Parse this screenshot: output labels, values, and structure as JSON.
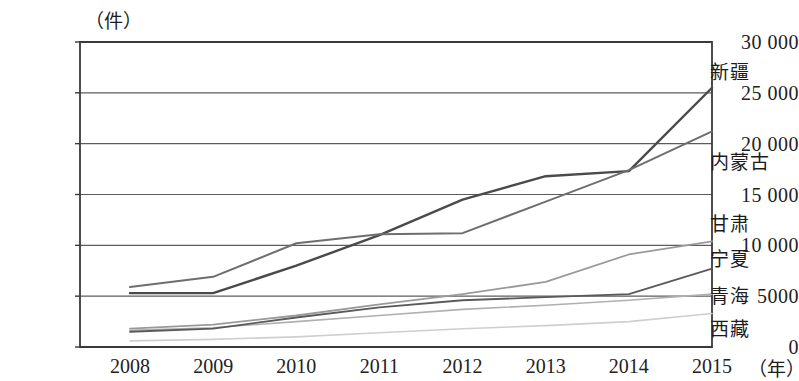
{
  "chart_data": {
    "type": "line",
    "title": "",
    "unit_y": "（件）",
    "unit_x": "（年）",
    "xlabel": "",
    "ylabel": "",
    "categories": [
      "2008",
      "2009",
      "2010",
      "2011",
      "2012",
      "2013",
      "2014",
      "2015"
    ],
    "ylim": [
      0,
      30000
    ],
    "yticks": [
      "0",
      "5000",
      "10 000",
      "15 000",
      "20 000",
      "25 000",
      "30 000"
    ],
    "ytick_values": [
      0,
      5000,
      10000,
      15000,
      20000,
      25000,
      30000
    ],
    "grid": true,
    "legend_position": "right-inline",
    "series": [
      {
        "name": "新疆",
        "color": "#4a4a4a",
        "width": 2.4,
        "values": [
          5300,
          5300,
          8000,
          11000,
          14500,
          16800,
          17300,
          25500
        ]
      },
      {
        "name": "内蒙古",
        "color": "#6e6e6e",
        "width": 2.0,
        "values": [
          5900,
          6900,
          10200,
          11100,
          11200,
          14300,
          17400,
          21200
        ]
      },
      {
        "name": "甘肃",
        "color": "#9a9a9a",
        "width": 1.8,
        "values": [
          1800,
          2200,
          3100,
          4200,
          5200,
          6400,
          9100,
          10400
        ]
      },
      {
        "name": "宁夏",
        "color": "#b0b0b0",
        "width": 1.6,
        "values": [
          1650,
          1900,
          2500,
          3100,
          3700,
          4100,
          4600,
          5200
        ]
      },
      {
        "name": "青海",
        "color": "#5a5a5a",
        "width": 1.8,
        "values": [
          1500,
          1800,
          2900,
          3900,
          4600,
          4900,
          5200,
          7700
        ]
      },
      {
        "name": "西藏",
        "color": "#cfcfcf",
        "width": 1.6,
        "values": [
          600,
          750,
          1000,
          1400,
          1800,
          2100,
          2500,
          3300
        ]
      }
    ]
  },
  "labels": {
    "xi_zang": "西藏",
    "qing_hai": "青海",
    "ning_xia": "宁夏",
    "gan_su": "甘肃",
    "nei_meng_gu": "内蒙古",
    "xin_jiang": "新疆"
  }
}
